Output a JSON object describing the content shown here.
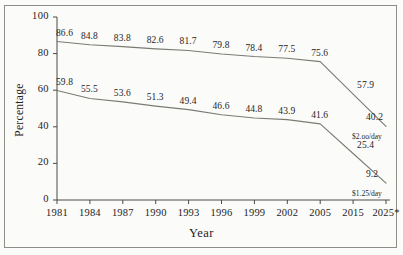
{
  "chart_data": {
    "type": "line",
    "title": "",
    "xlabel": "Year",
    "ylabel": "Percentage",
    "categories": [
      "1981",
      "1984",
      "1987",
      "1990",
      "1993",
      "1996",
      "1999",
      "2002",
      "2005",
      "2015",
      "2025*"
    ],
    "ylim": [
      0,
      100
    ],
    "yticks": [
      "0",
      "20",
      "40",
      "60",
      "80",
      "100"
    ],
    "grid": false,
    "legend_position": "end-of-line",
    "series": [
      {
        "name": "$2.00/day",
        "end_label": "$2.oo/day",
        "values": [
          86.6,
          84.8,
          83.8,
          82.6,
          81.7,
          79.8,
          78.4,
          77.5,
          75.6,
          57.9,
          40.2
        ]
      },
      {
        "name": "$1.25/day",
        "end_label": "$1.25/day",
        "values": [
          59.8,
          55.5,
          53.6,
          51.3,
          49.4,
          46.6,
          44.8,
          43.9,
          41.6,
          25.4,
          9.2
        ]
      }
    ]
  },
  "axis": {
    "y_title": "Percentage",
    "x_title": "Year"
  },
  "style": {
    "line_color": "#7b7b74",
    "axis_color": "#4a4a44",
    "frame_color": "#8d8d87",
    "background": "#fbfbf9",
    "text_color": "#23231f"
  }
}
